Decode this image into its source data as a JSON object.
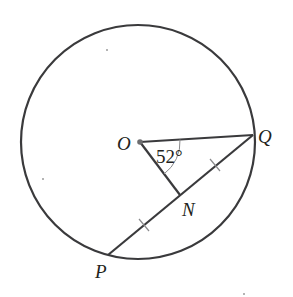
{
  "diagram": {
    "type": "geometry-circle",
    "colors": {
      "stroke": "#3a3a3c",
      "arc": "#8a8a8c",
      "text": "#231f20",
      "background": "#ffffff"
    },
    "circle": {
      "cx": 138,
      "cy": 142,
      "r": 117
    },
    "points": {
      "O": {
        "label": "O",
        "x": 140,
        "y": 142
      },
      "Q": {
        "label": "Q",
        "x": 253,
        "y": 135
      },
      "N": {
        "label": "N",
        "x": 180,
        "y": 195
      },
      "P": {
        "label": "P",
        "x": 108,
        "y": 255
      }
    },
    "segments": [
      {
        "from": "O",
        "to": "Q"
      },
      {
        "from": "O",
        "to": "N"
      },
      {
        "from": "P",
        "to": "Q"
      }
    ],
    "equal_marks": [
      "PN",
      "NQ"
    ],
    "angle": {
      "vertex": "O",
      "between": [
        "Q",
        "N"
      ],
      "value_label": "52°"
    },
    "labels": {
      "O": "O",
      "Q": "Q",
      "N": "N",
      "P": "P",
      "angle": "52°"
    }
  }
}
